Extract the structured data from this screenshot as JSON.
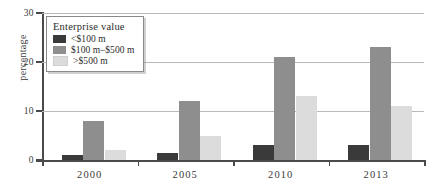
{
  "chart_data": {
    "type": "bar",
    "title": "",
    "xlabel": "",
    "ylabel": "percentage",
    "categories": [
      "2000",
      "2005",
      "2010",
      "2013"
    ],
    "ylim": [
      0,
      30
    ],
    "yticks": [
      0,
      10,
      20,
      30
    ],
    "grid": true,
    "legend_position": "top-left",
    "legend_title": "Enterprise value",
    "series": [
      {
        "name": "<$100 m",
        "color": "#3a3a3a",
        "values": [
          1,
          1.5,
          3,
          3
        ]
      },
      {
        "name": "$100 m–$500 m",
        "color": "#8e8e8e",
        "values": [
          8,
          12,
          21,
          23
        ]
      },
      {
        "name": ">$500 m",
        "color": "#dcdcdc",
        "values": [
          2,
          5,
          13,
          11
        ]
      }
    ]
  },
  "axis": {
    "ytick_labels": [
      "0",
      "10",
      "20",
      "30"
    ],
    "xtick_labels": [
      "2000",
      "2005",
      "2010",
      "2013"
    ],
    "ylabel": "percentage"
  },
  "legend": {
    "title": "Enterprise value",
    "items": [
      {
        "label": "<$100 m",
        "color": "#3a3a3a"
      },
      {
        "label": "$100 m–$500 m",
        "color": "#8e8e8e"
      },
      {
        "label": ">$500 m",
        "color": "#dcdcdc"
      }
    ]
  },
  "colors": {
    "small": "#3a3a3a",
    "medium": "#8e8e8e",
    "large": "#dcdcdc",
    "axis": "#4a4a4a",
    "grid": "#b9b9b9",
    "background": "#ffffff"
  }
}
